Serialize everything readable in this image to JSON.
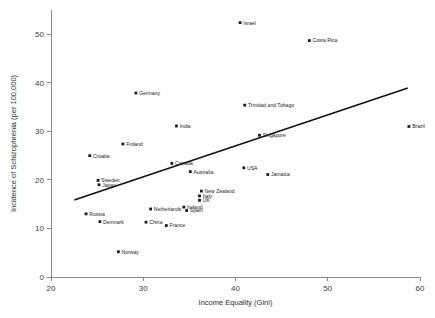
{
  "chart_data": {
    "type": "scatter",
    "title": "",
    "xlabel": "Income Equality (Gini)",
    "ylabel": "Incidence of Schizophrenia (per 100,000)",
    "xlim": [
      20,
      60
    ],
    "ylim": [
      0,
      55
    ],
    "xticks": [
      20,
      30,
      40,
      50,
      60
    ],
    "yticks": [
      0,
      10,
      20,
      30,
      40,
      50
    ],
    "grid": false,
    "legend": "none",
    "marker_color": "#1c1c1c",
    "trendline_color": "#111111",
    "trendline": {
      "type": "linear",
      "x_start": 22.6,
      "y_start": 15.9,
      "x_end": 58.6,
      "y_end": 38.9
    },
    "points": [
      {
        "label": "Israel",
        "x": 40.5,
        "y": 52.4,
        "label_pos": "right"
      },
      {
        "label": "Costa Rica",
        "x": 48.0,
        "y": 48.7,
        "label_pos": "right"
      },
      {
        "label": "Germany",
        "x": 29.2,
        "y": 37.9,
        "label_pos": "right"
      },
      {
        "label": "Trinidad and Tobago",
        "x": 41.0,
        "y": 35.4,
        "label_pos": "right"
      },
      {
        "label": "India",
        "x": 33.6,
        "y": 31.1,
        "label_pos": "right"
      },
      {
        "label": "Brazil",
        "x": 58.8,
        "y": 31.0,
        "label_pos": "right"
      },
      {
        "label": "Singapore",
        "x": 42.6,
        "y": 29.2,
        "label_pos": "right"
      },
      {
        "label": "Finland",
        "x": 27.8,
        "y": 27.4,
        "label_pos": "right"
      },
      {
        "label": "Croatia",
        "x": 24.2,
        "y": 25.0,
        "label_pos": "right"
      },
      {
        "label": "Canada",
        "x": 33.1,
        "y": 23.4,
        "label_pos": "right"
      },
      {
        "label": "USA",
        "x": 40.9,
        "y": 22.5,
        "label_pos": "right"
      },
      {
        "label": "Australia",
        "x": 35.1,
        "y": 21.7,
        "label_pos": "right"
      },
      {
        "label": "Jamaica",
        "x": 43.5,
        "y": 21.1,
        "label_pos": "right"
      },
      {
        "label": "Sweden",
        "x": 25.1,
        "y": 19.9,
        "label_pos": "right"
      },
      {
        "label": "Japan",
        "x": 25.2,
        "y": 19.0,
        "label_pos": "right"
      },
      {
        "label": "New Zealand",
        "x": 36.3,
        "y": 17.7,
        "label_pos": "right"
      },
      {
        "label": "Italy",
        "x": 36.1,
        "y": 16.7,
        "label_pos": "right"
      },
      {
        "label": "UK",
        "x": 36.1,
        "y": 15.8,
        "label_pos": "right"
      },
      {
        "label": "Netherlands",
        "x": 30.8,
        "y": 14.0,
        "label_pos": "right"
      },
      {
        "label": "Ireland",
        "x": 34.4,
        "y": 14.4,
        "label_pos": "right"
      },
      {
        "label": "Spain",
        "x": 34.7,
        "y": 13.7,
        "label_pos": "right"
      },
      {
        "label": "Russia",
        "x": 23.8,
        "y": 13.0,
        "label_pos": "right"
      },
      {
        "label": "Denmark",
        "x": 25.3,
        "y": 11.4,
        "label_pos": "right"
      },
      {
        "label": "China",
        "x": 30.3,
        "y": 11.3,
        "label_pos": "right"
      },
      {
        "label": "France",
        "x": 32.5,
        "y": 10.6,
        "label_pos": "right"
      },
      {
        "label": "Norway",
        "x": 27.3,
        "y": 5.2,
        "label_pos": "right"
      }
    ]
  }
}
